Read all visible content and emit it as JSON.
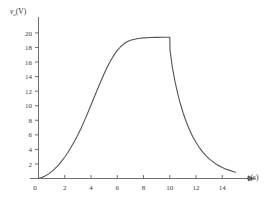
{
  "chart_data": {
    "type": "line",
    "title": "",
    "xlabel": "t (s)",
    "ylabel": "v_o (V)",
    "ylabel_symbol": "v",
    "ylabel_subscript": "o",
    "ylabel_unit": "(V)",
    "xlabel_symbol": "t",
    "xlabel_unit": "(s)",
    "xlim": [
      0,
      15.5
    ],
    "ylim": [
      0,
      21.5
    ],
    "xticks": [
      0,
      2,
      4,
      6,
      8,
      10,
      12,
      14
    ],
    "yticks": [
      2,
      4,
      6,
      8,
      10,
      12,
      14,
      16,
      18,
      20
    ],
    "origin_label": "0",
    "grid": false,
    "legend": null,
    "line_color": "#555555",
    "axis_color": "#6e6e6e",
    "background": "#ffffff",
    "plateau_value": 19.4,
    "switch_time": 10,
    "series": [
      {
        "name": "v_o(t)",
        "x": [
          0,
          0.25,
          0.5,
          0.75,
          1.0,
          1.25,
          1.5,
          1.75,
          2.0,
          2.25,
          2.5,
          2.75,
          3.0,
          3.25,
          3.5,
          3.75,
          4.0,
          4.25,
          4.5,
          4.75,
          5.0,
          5.25,
          5.5,
          5.75,
          6.0,
          6.25,
          6.5,
          6.75,
          7.0,
          7.25,
          7.5,
          7.75,
          8.0,
          8.5,
          9.0,
          9.5,
          10.0,
          10.02,
          10.2,
          10.4,
          10.6,
          10.8,
          11.0,
          11.25,
          11.5,
          11.75,
          12.0,
          12.25,
          12.5,
          12.75,
          13.0,
          13.25,
          13.5,
          13.75,
          14.0,
          14.25,
          14.5,
          14.75,
          15.0
        ],
        "y": [
          0.0,
          0.15,
          0.35,
          0.6,
          0.95,
          1.35,
          1.8,
          2.35,
          2.95,
          3.6,
          4.35,
          5.15,
          6.0,
          6.95,
          7.95,
          9.0,
          10.1,
          11.2,
          12.3,
          13.35,
          14.4,
          15.35,
          16.2,
          16.95,
          17.6,
          18.1,
          18.5,
          18.78,
          18.98,
          19.1,
          19.2,
          19.27,
          19.32,
          19.37,
          19.39,
          19.4,
          19.4,
          17.6,
          15.2,
          13.3,
          11.7,
          10.3,
          9.1,
          7.8,
          6.7,
          5.75,
          4.95,
          4.25,
          3.65,
          3.15,
          2.7,
          2.35,
          2.0,
          1.75,
          1.5,
          1.3,
          1.15,
          1.0,
          0.85
        ]
      }
    ]
  },
  "axis_marks": {
    "y_axis_arrow": false,
    "x_axis_arrow": true
  }
}
